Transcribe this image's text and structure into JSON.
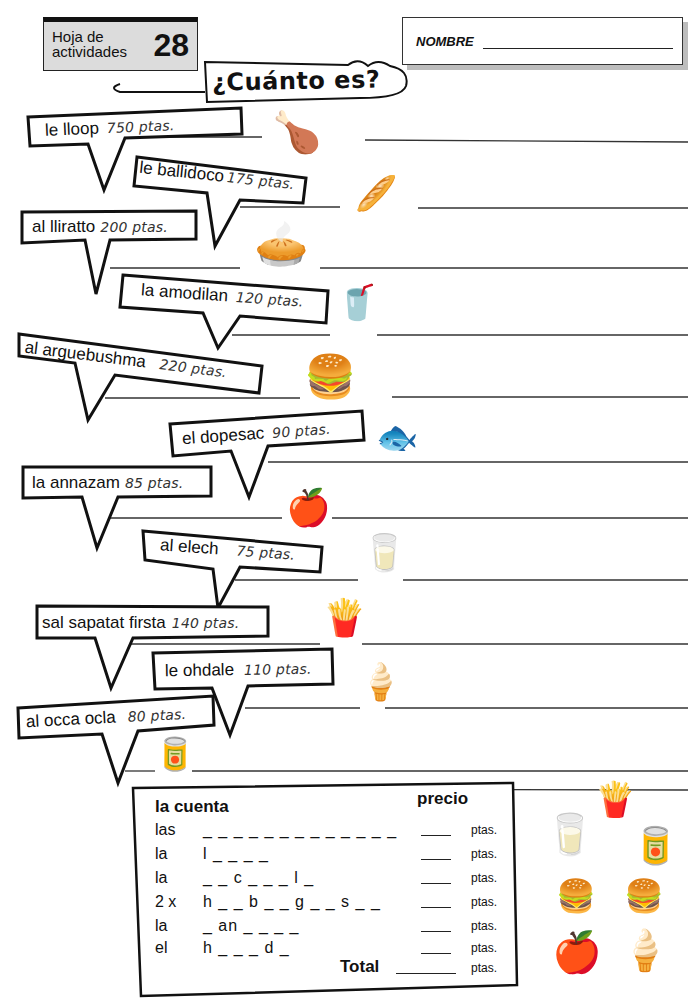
{
  "header": {
    "sheet_label": "Hoja de actividades",
    "sheet_number": "28",
    "name_label": "NOMBRE",
    "title": "¿Cuánto es?"
  },
  "items": [
    {
      "word": "le lloop",
      "price": "750 ptas.",
      "icon": "roast-chicken-icon",
      "glyph": "🍗"
    },
    {
      "word": "le ballidoco",
      "price": "175 ptas.",
      "icon": "baguette-sandwich-icon",
      "glyph": "🥖"
    },
    {
      "word": "al lliratto",
      "price": "200 ptas.",
      "icon": "tortilla-on-plate-icon",
      "glyph": "🥧"
    },
    {
      "word": "la amodilan",
      "price": "120 ptas.",
      "icon": "lemonade-glass-icon",
      "glyph": "🥤"
    },
    {
      "word": "al arguebushma",
      "price": "220 ptas.",
      "icon": "hamburger-icon",
      "glyph": "🍔"
    },
    {
      "word": "el dopesac",
      "price": "90 ptas.",
      "icon": "fish-icon",
      "glyph": "🐟"
    },
    {
      "word": "la annazam",
      "price": "85 ptas.",
      "icon": "apple-icon",
      "glyph": "🍎"
    },
    {
      "word": "al elech",
      "price": "75 ptas.",
      "icon": "milk-carton-icon",
      "glyph": "🥛"
    },
    {
      "word": "sal sapatat firsta",
      "price": "140 ptas.",
      "icon": "french-fries-icon",
      "glyph": "🍟"
    },
    {
      "word": "le ohdale",
      "price": "110 ptas.",
      "icon": "ice-cream-cone-icon",
      "glyph": "🍦"
    },
    {
      "word": "al occa ocla",
      "price": "80 ptas.",
      "icon": "cola-can-icon",
      "glyph": "🥫"
    }
  ],
  "bill": {
    "heading": "la cuenta",
    "price_heading": "precio",
    "rows": [
      {
        "article": "las",
        "word": "_ _ _ _ _ _ _   _ _ _ _ _ _",
        "unit": "ptas."
      },
      {
        "article": "la",
        "word": "l _ _ _ _",
        "unit": "ptas."
      },
      {
        "article": "la",
        "word": "_ _ c _   _ _ l _",
        "unit": "ptas."
      },
      {
        "article": "2 x",
        "word": "h _ _ b _ _ g _ _ s _ _",
        "unit": "ptas."
      },
      {
        "article": "la",
        "word": "_ an _ _ _ _",
        "unit": "ptas."
      },
      {
        "article": "el",
        "word": "h _ _ _ d _",
        "unit": "ptas."
      }
    ],
    "total_label": "Total",
    "total_unit": "ptas."
  },
  "side_icons": [
    {
      "icon": "french-fries-icon",
      "glyph": "🍟"
    },
    {
      "icon": "milk-carton-icon",
      "glyph": "🥛"
    },
    {
      "icon": "cola-can-icon",
      "glyph": "🥫"
    },
    {
      "icon": "hamburger-icon",
      "glyph": "🍔"
    },
    {
      "icon": "hamburger-icon",
      "glyph": "🍔"
    },
    {
      "icon": "apple-icon",
      "glyph": "🍎"
    },
    {
      "icon": "ice-cream-cone-icon",
      "glyph": "🍦"
    }
  ]
}
